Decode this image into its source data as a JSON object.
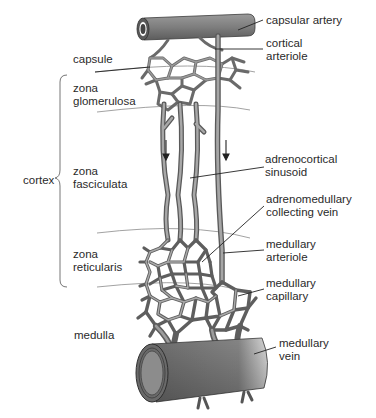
{
  "diagram": {
    "colors": {
      "vessel_fill": "#8a8a8a",
      "vessel_dark": "#4a4a4a",
      "vessel_light": "#b8b8b8",
      "leader_line": "#222222",
      "zone_line": "#777777",
      "text": "#2a2a2a",
      "background": "#ffffff"
    },
    "region_labels": {
      "capsule": "capsule",
      "zona_glomerulosa": "zona\nglomerulosa",
      "cortex": "cortex",
      "zona_fasciculata": "zona\nfasciculata",
      "zona_reticularis": "zona\nreticularis",
      "medulla": "medulla"
    },
    "structure_labels": {
      "capsular_artery": "capsular artery",
      "cortical_arteriole": "cortical\narteriole",
      "adrenocortical_sinusoid": "adrenocortical\nsinusoid",
      "adrenomedullary_collecting_vein": "adrenomedullary\ncollecting vein",
      "medullary_arteriole": "medullary\narteriole",
      "medullary_capillary": "medullary\ncapillary",
      "medullary_vein": "medullary\nvein"
    },
    "flow_arrows": [
      {
        "direction": "down",
        "location": "zona fasciculata sinusoid"
      },
      {
        "direction": "down",
        "location": "medullary arteriole"
      }
    ]
  }
}
